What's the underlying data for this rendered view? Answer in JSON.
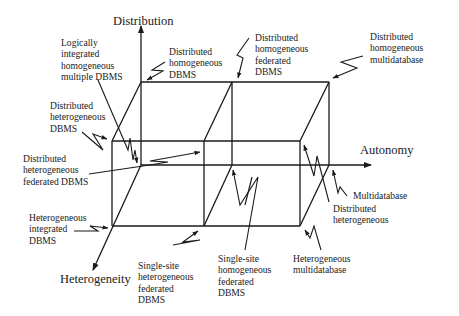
{
  "axes": {
    "distribution": "Distribution",
    "autonomy": "Autonomy",
    "heterogeneity": "Heterogeneity"
  },
  "labels": {
    "logically_integrated": "Logically\nintegrated\nhomogeneous\nmultiple DBMS",
    "distributed_homogeneous_dbms": "Distributed\nhomogeneous\nDBMS",
    "distributed_homogeneous_federated": "Distributed\nhomogeneous\nfederated\nDBMS",
    "distributed_homogeneous_multidatabase": "Distributed\nhomogeneous\nmultidatabase",
    "distributed_heterogeneous_dbms": "Distributed\nheterogeneous\nDBMS",
    "distributed_heterogeneous_federated": "Distributed\nheterogeneous\nfederated DBMS",
    "multidatabase": "Multidatabase",
    "distributed_heterogeneous": "Distributed\nheterogeneous",
    "heterogeneous_integrated": "Heterogeneous\nintegrated\nDBMS",
    "single_site_heterogeneous_federated": "Single-site\nheterogeneous\nfederated\nDBMS",
    "single_site_homogeneous_federated": "Single-site\nhomogeneous\nfederated\nDBMS",
    "heterogeneous_multidatabase": "Heterogeneous\nmultidatabase"
  },
  "colors": {
    "ink": "#1a1a1a",
    "background": "#ffffff"
  }
}
